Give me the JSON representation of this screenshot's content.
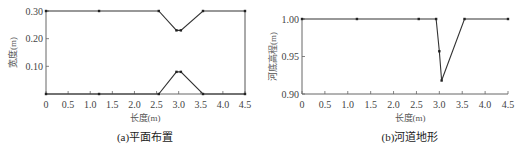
{
  "chart_data": [
    {
      "type": "line",
      "caption": "(a)平面布置",
      "xlabel": "长度(m)",
      "ylabel": "宽度(m)",
      "xlim": [
        0,
        4.5
      ],
      "ylim": [
        0,
        0.3
      ],
      "xticks": [
        "0",
        "0.5",
        "1.0",
        "1.5",
        "2.0",
        "2.5",
        "3.0",
        "3.5",
        "4.0",
        "4.5"
      ],
      "yticks": [
        "0.10",
        "0.20",
        "0.30"
      ],
      "grid": false,
      "series": [
        {
          "name": "upper-bank",
          "x": [
            0,
            1.2,
            2.55,
            2.95,
            3.05,
            3.55,
            4.5
          ],
          "y": [
            0.3,
            0.3,
            0.3,
            0.23,
            0.23,
            0.3,
            0.3
          ]
        },
        {
          "name": "lower-bank",
          "x": [
            0,
            1.2,
            2.55,
            2.95,
            3.05,
            3.55,
            4.5
          ],
          "y": [
            0,
            0,
            0,
            0.08,
            0.08,
            0,
            0
          ]
        }
      ]
    },
    {
      "type": "line",
      "caption": "(b)河道地形",
      "xlabel": "长度(m)",
      "ylabel": "河底高程(m)",
      "xlim": [
        0,
        4.5
      ],
      "ylim": [
        0.9,
        1.0
      ],
      "xticks": [
        "0",
        "0.5",
        "1.0",
        "1.5",
        "2.0",
        "2.5",
        "3.0",
        "3.5",
        "4.0",
        "4.5"
      ],
      "yticks": [
        "0.90",
        "0.95",
        "1.00"
      ],
      "grid": false,
      "series": [
        {
          "name": "bed-elevation",
          "x": [
            0,
            1.2,
            2.55,
            2.93,
            3.0,
            3.05,
            3.55,
            4.5
          ],
          "y": [
            1.0,
            1.0,
            1.0,
            1.0,
            0.957,
            0.918,
            1.0,
            1.0
          ]
        }
      ]
    }
  ]
}
